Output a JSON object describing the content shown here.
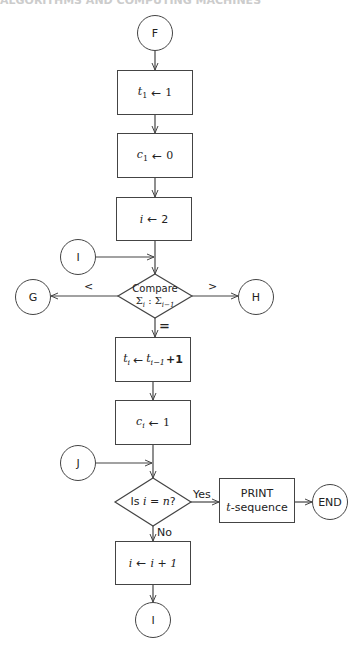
{
  "header": {
    "text": "ALGORITHMS AND COMPUTING MACHINES"
  },
  "connectors": {
    "F": "F",
    "I_in": "I",
    "G": "G",
    "H": "H",
    "J": "J",
    "END": "END",
    "I_out": "I"
  },
  "process_boxes": [
    {
      "id": "t1",
      "lhs": "t",
      "lhs_sub": "1",
      "arrow": "←",
      "rhs": "1"
    },
    {
      "id": "c1",
      "lhs": "c",
      "lhs_sub": "1",
      "arrow": "←",
      "rhs": "0"
    },
    {
      "id": "i2",
      "lhs": "i",
      "lhs_sub": "",
      "arrow": "←",
      "rhs": "2"
    },
    {
      "id": "ti",
      "lhs": "t",
      "lhs_sub": "i",
      "arrow": "←",
      "rhs": "t",
      "rhs_sub": "i−1",
      "rhs_suffix": "+1"
    },
    {
      "id": "ci",
      "lhs": "c",
      "lhs_sub": "i",
      "arrow": "←",
      "rhs": "1"
    },
    {
      "id": "inc",
      "lhs": "i",
      "lhs_sub": "",
      "arrow": "←",
      "rhs": "i + 1"
    }
  ],
  "decisions": {
    "compare": {
      "line1": "Compare",
      "sigma": "Σ",
      "sub_a": "i",
      "sep": " : ",
      "sub_b": "i−1",
      "less": "<",
      "greater": ">",
      "equal": "="
    },
    "is_n": {
      "prefix": "Is ",
      "expr": "i = n",
      "suffix": "?",
      "yes": "Yes",
      "no": "No"
    }
  },
  "print_box": {
    "line1": "PRINT",
    "line2_var": "t",
    "line2": "-sequence"
  },
  "colors": {
    "stroke": "#444444",
    "text": "#222222",
    "background": "#ffffff"
  }
}
